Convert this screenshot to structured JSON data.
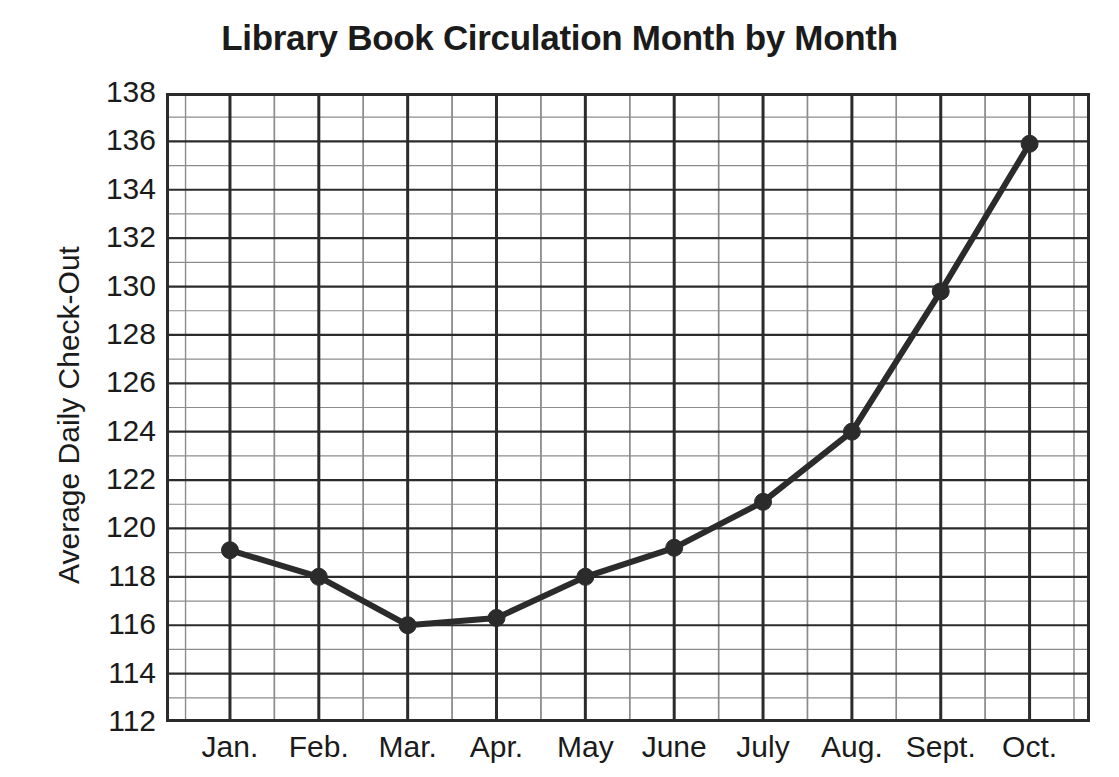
{
  "chart_data": {
    "type": "line",
    "title": "Library Book Circulation Month by Month",
    "xlabel": "",
    "ylabel": "Average Daily Check-Out",
    "categories": [
      "Jan.",
      "Feb.",
      "Mar.",
      "Apr.",
      "May",
      "June",
      "July",
      "Aug.",
      "Sept.",
      "Oct."
    ],
    "values": [
      119.1,
      118.0,
      116.0,
      116.3,
      118.0,
      119.2,
      121.1,
      124.0,
      129.8,
      135.9
    ],
    "series": [
      {
        "name": "Average Daily Check-Out",
        "values": [
          119.1,
          118.0,
          116.0,
          116.3,
          118.0,
          119.2,
          121.1,
          124.0,
          129.8,
          135.9
        ]
      }
    ],
    "ylim": [
      112,
      138
    ],
    "ytick_labels": [
      "138",
      "136",
      "134",
      "132",
      "130",
      "128",
      "126",
      "124",
      "122",
      "120",
      "118",
      "116",
      "114",
      "112"
    ],
    "ytick_values": [
      138,
      136,
      134,
      132,
      130,
      128,
      126,
      124,
      122,
      120,
      118,
      116,
      114,
      112
    ],
    "ytick_step": 2,
    "y_minor_step": 1,
    "grid": true,
    "grid_major_color": "#2b2b2b",
    "grid_minor_color": "#8c8c8c",
    "legend": false,
    "legend_position": "none",
    "line_color": "#2b2b2b",
    "marker_color": "#2b2b2b",
    "marker_shape": "circle",
    "background_color": "#ffffff"
  }
}
